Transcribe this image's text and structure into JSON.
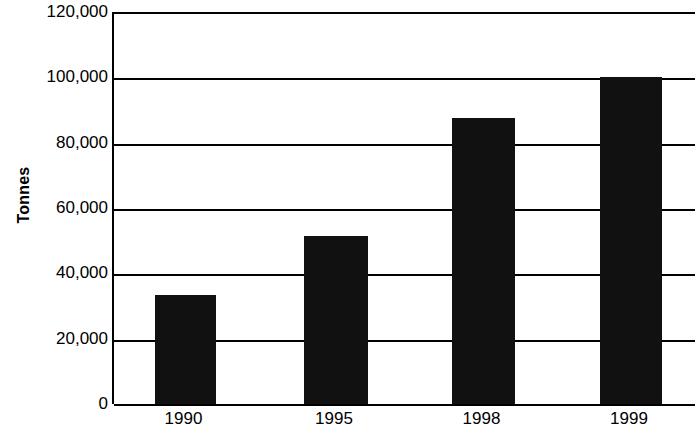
{
  "chart_data": {
    "type": "bar",
    "title": "",
    "subtitle": "",
    "xlabel": "",
    "ylabel": "Tonnes",
    "categories": [
      "1990",
      "1995",
      "1998",
      "1999"
    ],
    "values": [
      33500,
      51500,
      87500,
      100000
    ],
    "series": [
      {
        "name": "Tonnes",
        "values": [
          33500,
          51500,
          87500,
          100000
        ]
      }
    ],
    "ylim": [
      0,
      120000
    ],
    "ytick_values": [
      0,
      20000,
      40000,
      60000,
      80000,
      100000,
      120000
    ],
    "ytick_labels": [
      "0",
      "20,000",
      "40,000",
      "60,000",
      "80,000",
      "100,000",
      "120,000"
    ],
    "xtick_labels": [
      "1990",
      "1995",
      "1998",
      "1999"
    ],
    "grid": "horizontal",
    "legend": "none",
    "bar_color": "#111111",
    "axis_color": "#000000",
    "background_color": "#ffffff",
    "annotations": []
  },
  "axes": {
    "y_title": "Tonnes"
  }
}
